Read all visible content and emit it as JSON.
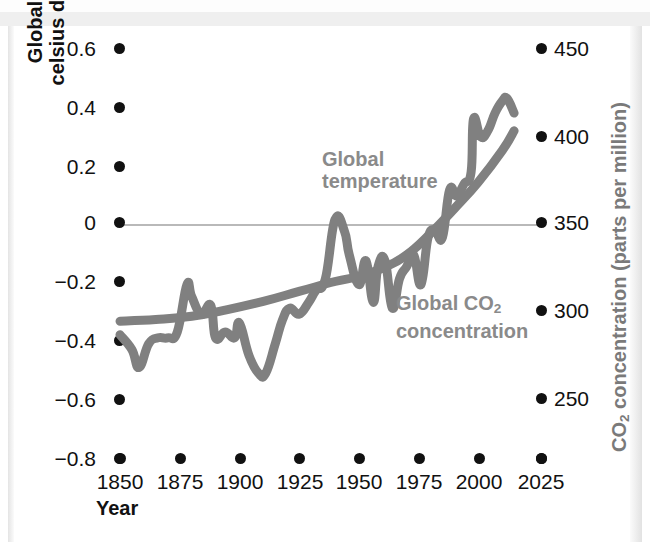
{
  "chart_data": {
    "type": "line",
    "title": "",
    "xlabel": "Year",
    "ylabel_left": "Global temperature (degrees celsius deviation from 1961–1990 average)",
    "ylabel_right": "CO2 concentration (parts per million)",
    "xlim": [
      1850,
      2025
    ],
    "xticks": [
      "1850",
      "1875",
      "1900",
      "1925",
      "1950",
      "1975",
      "2000",
      "2025"
    ],
    "xtick_values": [
      1850,
      1875,
      1900,
      1925,
      1950,
      1975,
      2000,
      2025
    ],
    "ylim_left": [
      -0.8,
      0.6
    ],
    "yticks_left": [
      "0.6",
      "0.4",
      "0.2",
      "0",
      "−0.2",
      "−0.4",
      "−0.6",
      "−0.8"
    ],
    "ytick_values_left": [
      0.6,
      0.4,
      0.2,
      0,
      -0.2,
      -0.4,
      -0.6,
      -0.8
    ],
    "ylim_right": [
      200,
      450
    ],
    "yticks_right": [
      "450",
      "400",
      "350",
      "300",
      "250",
      ""
    ],
    "ytick_values_right": [
      450,
      400,
      350,
      300,
      250,
      200
    ],
    "grid": false,
    "gridline_zero": true,
    "legend_position": "inline-annotations",
    "series": [
      {
        "name": "Global temperature",
        "axis": "left",
        "units": "degrees celsius deviation from 1961–1990 average",
        "x": [
          1850,
          1855,
          1858,
          1862,
          1866,
          1870,
          1874,
          1878,
          1880,
          1884,
          1888,
          1890,
          1894,
          1898,
          1900,
          1904,
          1908,
          1911,
          1915,
          1918,
          1921,
          1925,
          1929,
          1932,
          1936,
          1940,
          1944,
          1946,
          1950,
          1953,
          1956,
          1958,
          1961,
          1964,
          1967,
          1970,
          1973,
          1976,
          1979,
          1982,
          1985,
          1988,
          1991,
          1994,
          1997,
          1998,
          2001,
          2004,
          2007,
          2010,
          2012,
          2015
        ],
        "y": [
          -0.37,
          -0.42,
          -0.48,
          -0.4,
          -0.38,
          -0.38,
          -0.36,
          -0.2,
          -0.24,
          -0.3,
          -0.27,
          -0.38,
          -0.36,
          -0.38,
          -0.33,
          -0.44,
          -0.5,
          -0.5,
          -0.4,
          -0.32,
          -0.28,
          -0.3,
          -0.26,
          -0.22,
          -0.18,
          0.02,
          -0.02,
          -0.1,
          -0.2,
          -0.12,
          -0.26,
          -0.14,
          -0.12,
          -0.28,
          -0.18,
          -0.14,
          -0.1,
          -0.2,
          -0.04,
          -0.02,
          -0.04,
          0.12,
          0.1,
          0.14,
          0.18,
          0.36,
          0.3,
          0.32,
          0.38,
          0.42,
          0.43,
          0.38
        ],
        "notes": "noisy annual series; 1940s bump, 1910s minimum, sharp post-1975 rise"
      },
      {
        "name": "Global CO2 concentration",
        "axis": "right",
        "units": "parts per million",
        "x": [
          1850,
          1865,
          1880,
          1895,
          1910,
          1925,
          1940,
          1950,
          1960,
          1970,
          1980,
          1990,
          2000,
          2010,
          2015
        ],
        "y": [
          285,
          286,
          288,
          292,
          297,
          303,
          309,
          312,
          317,
          325,
          338,
          353,
          369,
          388,
          400
        ],
        "notes": "smooth monotonic rise, accelerating after 1950"
      }
    ],
    "annotations": [
      {
        "text": "Global temperature",
        "x": 1938,
        "y": 0.27
      },
      {
        "text": "Global CO2 concentration",
        "x": 1962,
        "y": -0.23
      }
    ],
    "colors": {
      "temperature_line": "#808080",
      "co2_line": "#808080",
      "tick_dot": "#111111",
      "zero_gridline": "#b9b9b9",
      "annotation_text": "#8a8a8a",
      "axis_text": "#111111",
      "right_axis_title": "#7a7a7a",
      "background": "#ffffff"
    }
  },
  "axes": {
    "left": {
      "title": "Global temperature (degrees celsius deviation from 1961–1990 average)",
      "ticks": [
        "0.6",
        "0.4",
        "0.2",
        "0",
        "−0.2",
        "−0.4",
        "−0.6",
        "−0.8"
      ]
    },
    "right": {
      "title_main": "CO",
      "title_sub": "2",
      "title_rest": " concentration (parts per million)",
      "ticks": [
        "450",
        "400",
        "350",
        "300",
        "250"
      ]
    },
    "bottom": {
      "title": "Year",
      "ticks": [
        "1850",
        "1875",
        "1900",
        "1925",
        "1950",
        "1975",
        "2000",
        "2025"
      ]
    }
  },
  "labels": {
    "temperature_line1": "Global",
    "temperature_line2": "temperature",
    "co2_line1_main": "Global CO",
    "co2_line1_sub": "2",
    "co2_line2": "concentration"
  }
}
